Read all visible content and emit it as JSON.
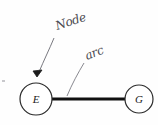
{
  "figure": {
    "kind": "hand-annotated-graph-diagram",
    "background_color": "#fefefe",
    "ink_color": "#1a1a1a",
    "annotation_ink_color": "#4a4a50",
    "nodes": [
      {
        "id": "E",
        "label": "E",
        "cx": 36,
        "cy": 99,
        "r": 16
      },
      {
        "id": "G",
        "label": "G",
        "cx": 139,
        "cy": 99,
        "r": 14
      }
    ],
    "edges": [
      {
        "from": "E",
        "to": "G",
        "x1": 52,
        "y1": 99,
        "x2": 125,
        "y2": 99,
        "stroke_width": 3
      }
    ],
    "annotations": [
      {
        "id": "node-annotation",
        "text": "Node",
        "text_x": 57,
        "text_y": 30,
        "rotation": -18,
        "leader_path": "M 54 38 C 49 50 44 60 39 72",
        "arrowhead_x": 37,
        "arrowhead_y": 76,
        "points_to": "E"
      },
      {
        "id": "arc-annotation",
        "text": "arc",
        "text_x": 87,
        "text_y": 60,
        "rotation": -22,
        "leader_path": "M 84 63 C 78 73 72 84 67 96",
        "points_to": "edge-E-G"
      }
    ],
    "stray_mark": {
      "x": 2,
      "y": 80,
      "width": 3,
      "height": 2
    }
  }
}
